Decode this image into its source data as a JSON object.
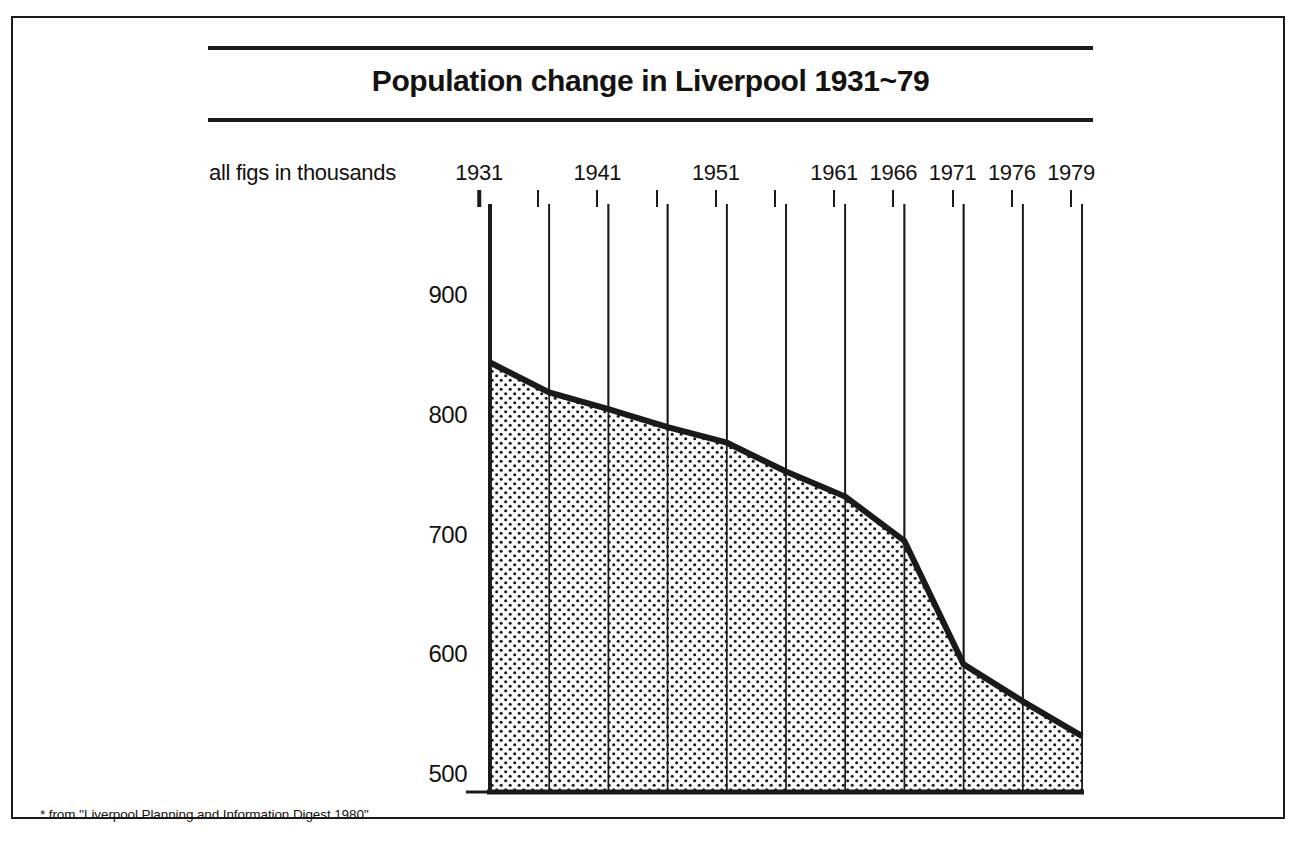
{
  "figure": {
    "title": "Population change in Liverpool 1931~79",
    "units_note": "all figs in thousands",
    "footnote": "* from ''Liverpool Planning and Information Digest 1980''",
    "ink_color": "#1a1a1a",
    "fill_pattern": "dot-stipple",
    "background": "#ffffff"
  },
  "chart_data": {
    "type": "area",
    "title": "Population change in Liverpool 1931~79",
    "subtitle": "all figs in thousands",
    "xlabel": "",
    "ylabel": "",
    "note": "* from ''Liverpool Planning and Information Digest 1980''",
    "grid": true,
    "legend": "none",
    "xlim": [
      1931,
      1979
    ],
    "ylim": [
      500,
      900
    ],
    "yticks": [
      900,
      800,
      700,
      600,
      500
    ],
    "ytick_labels": [
      "900",
      "800",
      "700",
      "600",
      "500"
    ],
    "xticks": [
      1931,
      1936,
      1941,
      1946,
      1951,
      1956,
      1961,
      1966,
      1971,
      1976,
      1979
    ],
    "xtick_labels": [
      "1931",
      "",
      "1941",
      "",
      "1951",
      "",
      "1961",
      "1966",
      "1971",
      "1976",
      "1979"
    ],
    "labelled_years": [
      "1931",
      "1941",
      "1951",
      "1961",
      "1966",
      "1971",
      "1976",
      "1979"
    ],
    "x": [
      1931,
      1936,
      1941,
      1946,
      1951,
      1956,
      1961,
      1966,
      1971,
      1976,
      1979
    ],
    "values": [
      857,
      832,
      818,
      803,
      790,
      766,
      745,
      708,
      605,
      574,
      545
    ],
    "series": [
      {
        "name": "Liverpool population (thousands)",
        "values": [
          857,
          832,
          818,
          803,
          790,
          766,
          745,
          708,
          605,
          574,
          545
        ]
      }
    ]
  },
  "axis": {
    "y_labels": [
      {
        "text": "900",
        "value": 900
      },
      {
        "text": "800",
        "value": 800
      },
      {
        "text": "700",
        "value": 700
      },
      {
        "text": "600",
        "value": 600
      },
      {
        "text": "500",
        "value": 500
      }
    ],
    "x_labels": [
      {
        "text": "1931",
        "value": 1931
      },
      {
        "text": "1941",
        "value": 1941
      },
      {
        "text": "1951",
        "value": 1951
      },
      {
        "text": "1961",
        "value": 1961
      },
      {
        "text": "1966",
        "value": 1966
      },
      {
        "text": "1971",
        "value": 1971
      },
      {
        "text": "1976",
        "value": 1976
      },
      {
        "text": "1979",
        "value": 1979
      }
    ]
  }
}
